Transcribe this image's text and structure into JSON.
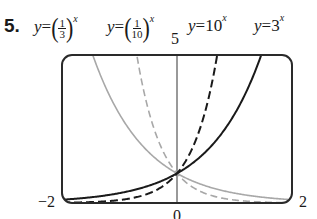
{
  "problem_number": "5.",
  "equations": [
    {
      "id": "one_third",
      "lhs": "y",
      "eqsign": "=",
      "base_num": "1",
      "base_den": "3",
      "exp": "x"
    },
    {
      "id": "one_tenth",
      "lhs": "y",
      "eqsign": "=",
      "base_num": "1",
      "base_den": "10",
      "exp": "x"
    },
    {
      "id": "ten",
      "lhs": "y",
      "eqsign": "=",
      "base": "10",
      "exp": "x"
    },
    {
      "id": "three",
      "lhs": "y",
      "eqsign": "=",
      "base": "3",
      "exp": "x"
    }
  ],
  "axis_labels": {
    "ymax": "5",
    "xmin": "−2",
    "xmax": "2",
    "origin": "0"
  },
  "colors": {
    "frame": "#2a2a2a",
    "axis": "#555555",
    "black_curve": "#1a1a1a",
    "gray_curve": "#a8a8a8"
  },
  "chart_data": {
    "type": "line",
    "title": "",
    "xlabel": "",
    "ylabel": "",
    "xlim": [
      -2,
      2
    ],
    "ylim": [
      0,
      5
    ],
    "grid": false,
    "legend": "labels above plot",
    "tick_labels": {
      "x": [
        "-2",
        "0",
        "2"
      ],
      "y": [
        "5"
      ]
    },
    "series": [
      {
        "name": "y = (1/3)^x",
        "style": "gray solid",
        "x": [
          -2,
          -1.465,
          -1,
          -0.5,
          0,
          0.5,
          1,
          1.5,
          2
        ],
        "y": [
          9,
          5,
          3,
          1.732,
          1,
          0.577,
          0.333,
          0.192,
          0.111
        ]
      },
      {
        "name": "y = (1/10)^x",
        "style": "gray dashed",
        "x": [
          -2,
          -0.699,
          -0.5,
          -0.25,
          0,
          0.5,
          1,
          1.5,
          2
        ],
        "y": [
          100,
          5,
          3.162,
          1.778,
          1,
          0.316,
          0.1,
          0.032,
          0.01
        ]
      },
      {
        "name": "y = 10^x",
        "style": "black dashed",
        "x": [
          -2,
          -1.5,
          -1,
          -0.5,
          0,
          0.25,
          0.5,
          0.699,
          2
        ],
        "y": [
          0.01,
          0.032,
          0.1,
          0.316,
          1,
          1.778,
          3.162,
          5,
          100
        ]
      },
      {
        "name": "y = 3^x",
        "style": "black solid",
        "x": [
          -2,
          -1.5,
          -1,
          -0.5,
          0,
          0.5,
          1,
          1.465,
          2
        ],
        "y": [
          0.111,
          0.192,
          0.333,
          0.577,
          1,
          1.732,
          3,
          5,
          9
        ]
      }
    ]
  }
}
